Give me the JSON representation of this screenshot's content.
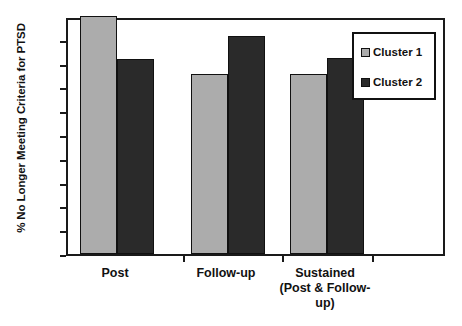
{
  "chart_data": {
    "type": "bar",
    "title": "",
    "xlabel": "",
    "ylabel": "% No Longer Meeting Criteria for PTSD",
    "categories": [
      "Post",
      "Follow-up",
      "Sustained (Post & Follow-up)"
    ],
    "category_lines": [
      [
        "Post"
      ],
      [
        "Follow-up"
      ],
      [
        "Sustained",
        "(Post & Follow-",
        "up)"
      ]
    ],
    "series": [
      {
        "name": "Cluster 1",
        "color": "#acacac",
        "values": [
          100,
          75.5,
          75.5
        ]
      },
      {
        "name": "Cluster 2",
        "color": "#2a2a2a",
        "values": [
          82,
          91.5,
          82.5
        ]
      }
    ],
    "ylim": [
      0,
      100
    ],
    "yticks": [
      0,
      10,
      20,
      30,
      40,
      50,
      60,
      70,
      80,
      90,
      100
    ],
    "ytick_labels": [
      "0",
      "10",
      "20",
      "30",
      "40",
      "50",
      "60",
      "70",
      "80",
      "90",
      "100"
    ],
    "grid": false,
    "legend_position": "top-right"
  },
  "legend": {
    "entries": [
      {
        "label": "Cluster 1"
      },
      {
        "label": "Cluster 2"
      }
    ]
  },
  "caption": {
    "text": ""
  },
  "colors": {
    "cluster1": "#acacac",
    "cluster2": "#2a2a2a",
    "axis": "#1a1a1a",
    "background": "#ffffff"
  }
}
